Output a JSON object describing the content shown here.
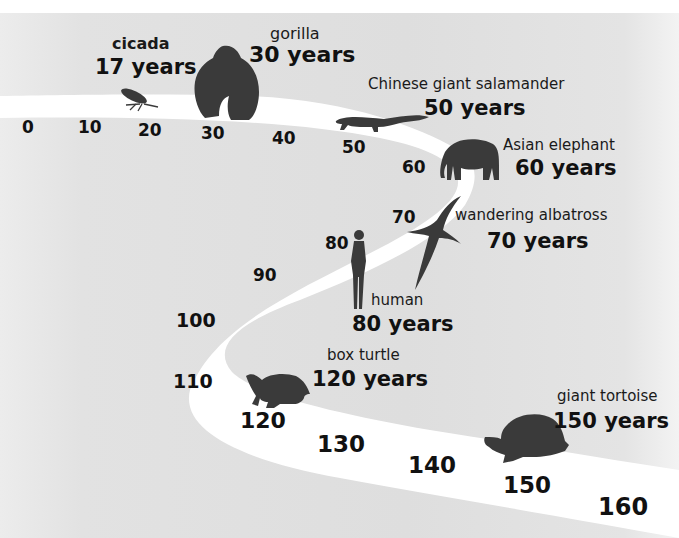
{
  "diagram": {
    "colors": {
      "background": "#dfdfdf",
      "road": "#ffffff",
      "silhouette": "#3a3a3a",
      "text": "#111111"
    },
    "ticks": [
      "0",
      "10",
      "20",
      "30",
      "40",
      "50",
      "60",
      "70",
      "80",
      "90",
      "100",
      "110",
      "120",
      "130",
      "140",
      "150",
      "160"
    ],
    "animals": [
      {
        "name": "cicada",
        "years": "17 years",
        "icon": "cicada-icon"
      },
      {
        "name": "gorilla",
        "years": "30 years",
        "icon": "gorilla-icon"
      },
      {
        "name": "Chinese giant salamander",
        "years": "50 years",
        "icon": "salamander-icon"
      },
      {
        "name": "Asian elephant",
        "years": "60 years",
        "icon": "elephant-icon"
      },
      {
        "name": "wandering albatross",
        "years": "70 years",
        "icon": "albatross-icon"
      },
      {
        "name": "human",
        "years": "80 years",
        "icon": "human-icon"
      },
      {
        "name": "box turtle",
        "years": "120 years",
        "icon": "turtle-icon"
      },
      {
        "name": "giant tortoise",
        "years": "150 years",
        "icon": "tortoise-icon"
      }
    ]
  }
}
